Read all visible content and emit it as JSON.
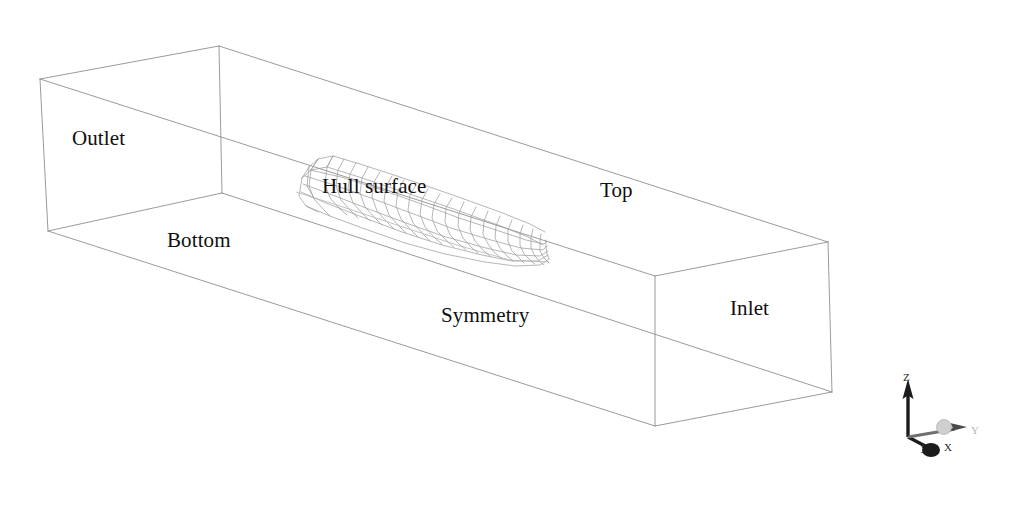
{
  "figure": {
    "type": "cfd-computational-domain-wireframe",
    "background_color": "#ffffff",
    "wireframe_color": "#8a8a8a",
    "hull_mesh_color": "#9a9a9a",
    "label_color": "#101010"
  },
  "labels": {
    "outlet": "Outlet",
    "bottom": "Bottom",
    "hull_surface": "Hull surface",
    "top": "Top",
    "symmetry": "Symmetry",
    "inlet": "Inlet"
  },
  "boundaries": [
    {
      "id": "outlet",
      "label": "Outlet",
      "face": "left-end-face",
      "x": 72,
      "y": 128
    },
    {
      "id": "bottom",
      "label": "Bottom",
      "face": "bottom-face",
      "x": 167,
      "y": 230
    },
    {
      "id": "hull",
      "label": "Hull surface",
      "face": "hull-body",
      "x": 322,
      "y": 176
    },
    {
      "id": "top",
      "label": "Top",
      "face": "top-face",
      "x": 600,
      "y": 180
    },
    {
      "id": "symmetry",
      "label": "Symmetry",
      "face": "front-face",
      "x": 441,
      "y": 305
    },
    {
      "id": "inlet",
      "label": "Inlet",
      "face": "right-end-face",
      "x": 730,
      "y": 298
    }
  ],
  "axes_triad": {
    "origin_x": 908,
    "origin_y": 437,
    "axes": [
      {
        "name": "z-axis",
        "label": "Z",
        "direction": "up",
        "color": "#1c1c1c",
        "label_x": 903,
        "label_y": 372
      },
      {
        "name": "x-axis",
        "label": "X",
        "direction": "down-left",
        "color": "#1c1c1c",
        "label_x": 944,
        "label_y": 442
      },
      {
        "name": "y-axis",
        "label": "Y",
        "direction": "right",
        "color": "#b8b8b8",
        "label_x": 971,
        "label_y": 425
      }
    ],
    "origin_marker": {
      "name": "origin-sphere",
      "color": "#c9c9c9",
      "cx": 944,
      "cy": 427,
      "r": 7
    }
  },
  "domain_box": {
    "description": "Rectangular computational domain drawn in oblique projection",
    "vertices": {
      "front_top_left": [
        40,
        79
      ],
      "rear_top_left": [
        219,
        46
      ],
      "front_top_right": [
        655,
        276
      ],
      "rear_top_right": [
        828,
        242
      ],
      "front_bot_left": [
        48,
        231
      ],
      "rear_bot_left": [
        222,
        193
      ],
      "front_bot_right": [
        655,
        426
      ],
      "rear_bot_right": [
        832,
        392
      ]
    }
  },
  "hull": {
    "description": "Half ship hull surface mesh with transverse stations and longitudinal waterlines",
    "station_count": 22,
    "waterline_count": 6,
    "bounds": [
      296,
      152,
      552,
      268
    ]
  }
}
